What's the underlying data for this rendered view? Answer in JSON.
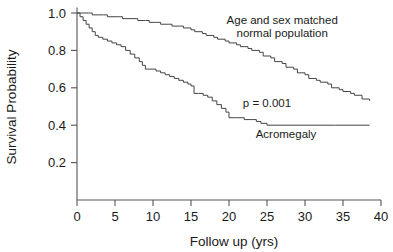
{
  "chart_data": {
    "type": "line",
    "title": "",
    "xlabel": "Follow up (yrs)",
    "ylabel": "Survival Probability",
    "xlim": [
      0,
      40
    ],
    "ylim": [
      0,
      1.05
    ],
    "xticks": [
      0,
      5,
      10,
      15,
      20,
      25,
      30,
      35,
      40
    ],
    "xticklabels": [
      "0",
      "5",
      "10",
      "15",
      "20",
      "25",
      "30",
      "35",
      "40"
    ],
    "yticks": [
      0.2,
      0.4,
      0.6,
      0.8,
      1.0
    ],
    "yticklabels": [
      "0.2",
      "0.4",
      "0.6",
      "0.8",
      "1.0"
    ],
    "grid": false,
    "legend_position": "inline-annotation",
    "annotations": [
      {
        "id": "pvalue",
        "text": "p = 0.001",
        "x": 25.0,
        "y": 0.5
      },
      {
        "id": "normal-label-line1",
        "text": "Age and sex matched",
        "x": 27.0,
        "y": 0.94
      },
      {
        "id": "normal-label-line2",
        "text": "normal population",
        "x": 27.0,
        "y": 0.87
      },
      {
        "id": "acromegaly-label",
        "text": "Acromegaly",
        "x": 27.5,
        "y": 0.33
      }
    ],
    "series": [
      {
        "name": "Age and sex matched normal population",
        "color": "#444444",
        "style": "step",
        "x": [
          0.0,
          1.5,
          2.0,
          3.5,
          4.0,
          5.5,
          6.0,
          7.5,
          8.0,
          9.0,
          9.5,
          10.5,
          11.0,
          12.0,
          12.5,
          13.5,
          14.0,
          15.0,
          15.5,
          16.5,
          17.0,
          18.0,
          18.5,
          19.5,
          20.0,
          21.0,
          21.5,
          22.5,
          23.0,
          24.0,
          24.5,
          25.5,
          26.0,
          27.0,
          27.5,
          28.5,
          29.0,
          30.0,
          30.5,
          31.5,
          32.0,
          33.0,
          33.5,
          34.5,
          35.0,
          36.0,
          36.5,
          37.5,
          38.5
        ],
        "y": [
          1.0,
          1.0,
          0.99,
          0.99,
          0.98,
          0.98,
          0.97,
          0.97,
          0.96,
          0.96,
          0.95,
          0.95,
          0.94,
          0.94,
          0.93,
          0.93,
          0.92,
          0.91,
          0.9,
          0.89,
          0.88,
          0.87,
          0.86,
          0.85,
          0.84,
          0.83,
          0.82,
          0.81,
          0.8,
          0.79,
          0.77,
          0.76,
          0.74,
          0.73,
          0.71,
          0.7,
          0.68,
          0.67,
          0.65,
          0.64,
          0.63,
          0.62,
          0.6,
          0.59,
          0.58,
          0.57,
          0.56,
          0.54,
          0.53
        ]
      },
      {
        "name": "Acromegaly",
        "color": "#444444",
        "style": "step",
        "x": [
          0.0,
          0.4,
          0.8,
          1.2,
          1.6,
          2.0,
          2.4,
          2.8,
          3.4,
          4.0,
          4.6,
          5.2,
          5.8,
          6.4,
          7.0,
          7.6,
          8.2,
          8.6,
          9.0,
          9.6,
          10.4,
          11.0,
          11.6,
          12.2,
          12.8,
          13.4,
          14.0,
          14.6,
          15.0,
          15.4,
          16.0,
          16.6,
          17.2,
          17.8,
          18.4,
          19.0,
          19.6,
          20.0,
          21.0,
          22.0,
          23.0,
          23.6,
          24.2,
          25.0,
          30.0,
          34.0,
          38.5
        ],
        "y": [
          1.0,
          0.98,
          0.96,
          0.94,
          0.92,
          0.9,
          0.88,
          0.87,
          0.86,
          0.85,
          0.84,
          0.83,
          0.82,
          0.8,
          0.78,
          0.76,
          0.74,
          0.72,
          0.7,
          0.7,
          0.69,
          0.68,
          0.67,
          0.66,
          0.65,
          0.64,
          0.63,
          0.62,
          0.61,
          0.57,
          0.57,
          0.56,
          0.55,
          0.53,
          0.51,
          0.49,
          0.47,
          0.44,
          0.44,
          0.43,
          0.43,
          0.42,
          0.41,
          0.4,
          0.4,
          0.4,
          0.4
        ]
      }
    ]
  }
}
